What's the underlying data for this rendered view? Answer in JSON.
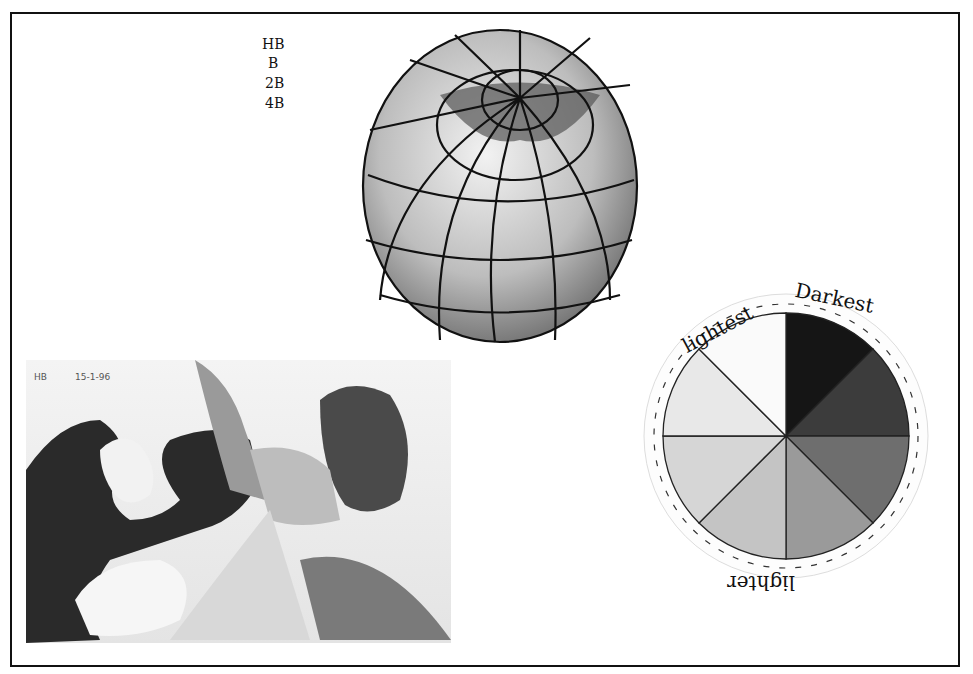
{
  "pencil_grades": [
    "HB",
    "B",
    "2B",
    "4B"
  ],
  "tonal_study": {
    "label": "HB",
    "date": "15-1-96"
  },
  "tone_wheel": {
    "labels": {
      "lightest": "lightest",
      "darkest": "Darkest",
      "lighter": "lighter"
    },
    "segments": 8,
    "shades": [
      "#151515",
      "#3c3c3c",
      "#6e6e6e",
      "#9a9a9a",
      "#c4c4c4",
      "#d6d6d6",
      "#e8e8e8",
      "#fafafa"
    ]
  }
}
